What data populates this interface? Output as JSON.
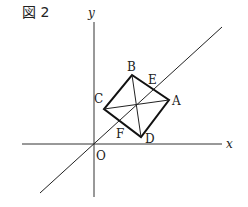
{
  "figure": {
    "title": "図 2"
  },
  "axes": {
    "x_label": "x",
    "y_label": "y",
    "origin_label": "O"
  },
  "points": {
    "A": "A",
    "B": "B",
    "C": "C",
    "D": "D",
    "E": "E",
    "F": "F"
  },
  "colors": {
    "line": "#222222",
    "axis": "#333333",
    "background": "#ffffff"
  }
}
